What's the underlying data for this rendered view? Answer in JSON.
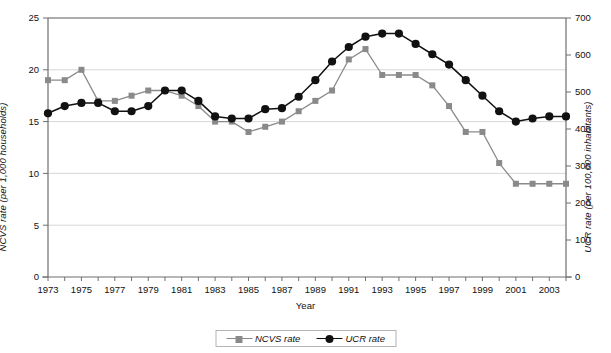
{
  "chart_data": {
    "type": "line",
    "title": "",
    "xlabel": "Year",
    "ylabel": "NCVS rate  (per 1,000 households)",
    "y2label": "UCR rate  (per 100,000 inhabitants)",
    "grid": true,
    "legend_position": "bottom-center",
    "xlim": [
      1973,
      2004
    ],
    "ylim": [
      0,
      25
    ],
    "y2lim": [
      0,
      700
    ],
    "yticks": [
      0,
      5,
      10,
      15,
      20,
      25
    ],
    "y2ticks": [
      0,
      100,
      200,
      300,
      400,
      500,
      600,
      700
    ],
    "x": [
      1973,
      1974,
      1975,
      1976,
      1977,
      1978,
      1979,
      1980,
      1981,
      1982,
      1983,
      1984,
      1985,
      1986,
      1987,
      1988,
      1989,
      1990,
      1991,
      1992,
      1993,
      1994,
      1995,
      1996,
      1997,
      1998,
      1999,
      2000,
      2001,
      2002,
      2003,
      2004
    ],
    "xtick_labels": [
      "1973",
      "",
      "1975",
      "",
      "1977",
      "",
      "1979",
      "",
      "1981",
      "",
      "1983",
      "",
      "1985",
      "",
      "1987",
      "",
      "1989",
      "",
      "1991",
      "",
      "1993",
      "",
      "1995",
      "",
      "1997",
      "",
      "1999",
      "",
      "2001",
      "",
      "2003",
      ""
    ],
    "series": [
      {
        "name": "NCVS rate",
        "axis": "left",
        "color": "#8a8a8a",
        "marker": "square",
        "units": "per 1,000 households",
        "values": [
          19.0,
          19.0,
          20.0,
          17.0,
          17.0,
          17.5,
          18.0,
          18.0,
          17.5,
          16.5,
          15.0,
          15.0,
          14.0,
          14.5,
          15.0,
          16.0,
          17.0,
          18.0,
          21.0,
          22.0,
          19.5,
          19.5,
          19.5,
          18.5,
          16.5,
          14.0,
          14.0,
          11.0,
          9.0,
          9.0,
          9.0,
          9.0
        ]
      },
      {
        "name": "UCR rate",
        "axis": "right",
        "color": "#111111",
        "marker": "circle",
        "units": "per 100,000 inhabitants",
        "values_left_scale": [
          15.8,
          16.5,
          16.8,
          16.8,
          16.0,
          16.0,
          16.5,
          18.0,
          18.0,
          17.0,
          15.5,
          15.3,
          15.3,
          16.2,
          16.3,
          17.4,
          19.0,
          20.8,
          22.2,
          23.2,
          23.5,
          23.5,
          22.5,
          21.5,
          20.5,
          19.0,
          17.5,
          16.0,
          15.0,
          15.3,
          15.5,
          15.5
        ],
        "values": [
          442,
          462,
          470,
          470,
          448,
          448,
          462,
          504,
          504,
          476,
          434,
          428,
          428,
          454,
          456,
          487,
          532,
          582,
          622,
          650,
          658,
          658,
          630,
          602,
          574,
          532,
          490,
          448,
          420,
          428,
          434,
          434
        ]
      }
    ]
  },
  "legend": {
    "items": [
      {
        "label": "NCVS rate",
        "marker": "square-marker-icon"
      },
      {
        "label": "UCR rate",
        "marker": "circle-marker-icon"
      }
    ]
  }
}
